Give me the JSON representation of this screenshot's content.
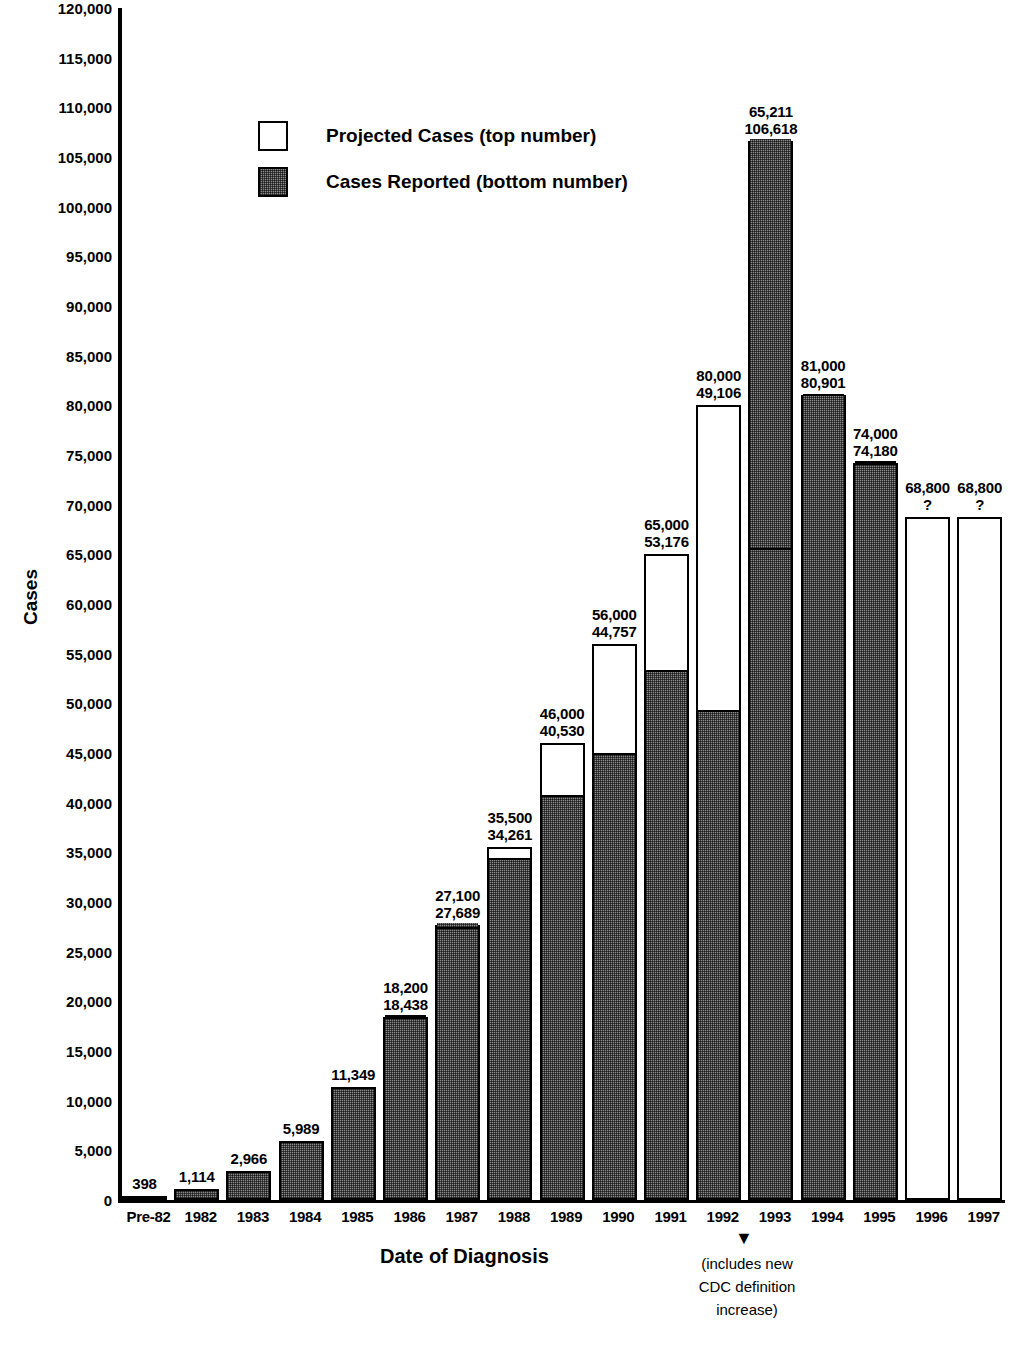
{
  "chart_data": {
    "type": "bar",
    "title": "",
    "xlabel": "Date of Diagnosis",
    "ylabel": "Cases",
    "ylim": [
      0,
      120000
    ],
    "ytick_step": 5000,
    "grid": false,
    "legend_position": "upper-left-inside",
    "categories": [
      "Pre-82",
      "1982",
      "1983",
      "1984",
      "1985",
      "1986",
      "1987",
      "1988",
      "1989",
      "1990",
      "1991",
      "1992",
      "1993",
      "1994",
      "1995",
      "1996",
      "1997"
    ],
    "series": [
      {
        "name": "Projected Cases (top number)",
        "key": "projected",
        "values": [
          null,
          null,
          null,
          null,
          null,
          18200,
          27100,
          35500,
          46000,
          56000,
          65000,
          80000,
          65211,
          81000,
          74000,
          68800,
          68800
        ]
      },
      {
        "name": "Cases Reported (bottom number)",
        "key": "reported",
        "values": [
          398,
          1114,
          2966,
          5989,
          11349,
          18438,
          27689,
          34261,
          40530,
          44757,
          53176,
          49106,
          106618,
          80901,
          74180,
          null,
          null
        ]
      }
    ],
    "bar_labels": [
      {
        "category": "Pre-82",
        "top": "",
        "bottom": "398"
      },
      {
        "category": "1982",
        "top": "",
        "bottom": "1,114"
      },
      {
        "category": "1983",
        "top": "",
        "bottom": "2,966"
      },
      {
        "category": "1984",
        "top": "",
        "bottom": "5,989"
      },
      {
        "category": "1985",
        "top": "",
        "bottom": "11,349"
      },
      {
        "category": "1986",
        "top": "18,200",
        "bottom": "18,438"
      },
      {
        "category": "1987",
        "top": "27,100",
        "bottom": "27,689"
      },
      {
        "category": "1988",
        "top": "35,500",
        "bottom": "34,261"
      },
      {
        "category": "1989",
        "top": "46,000",
        "bottom": "40,530"
      },
      {
        "category": "1990",
        "top": "56,000",
        "bottom": "44,757"
      },
      {
        "category": "1991",
        "top": "65,000",
        "bottom": "53,176"
      },
      {
        "category": "1992",
        "top": "80,000",
        "bottom": "49,106"
      },
      {
        "category": "1993",
        "top": "65,211",
        "bottom": "106,618"
      },
      {
        "category": "1994",
        "top": "81,000",
        "bottom": "80,901"
      },
      {
        "category": "1995",
        "top": "74,000",
        "bottom": "74,180"
      },
      {
        "category": "1996",
        "top": "68,800",
        "bottom": "?"
      },
      {
        "category": "1997",
        "top": "68,800",
        "bottom": "?"
      }
    ],
    "ytick_labels": [
      "120,000",
      "115,000",
      "110,000",
      "105,000",
      "100,000",
      "95,000",
      "90,000",
      "85,000",
      "80,000",
      "75,000",
      "70,000",
      "65,000",
      "60,000",
      "55,000",
      "50,000",
      "45,000",
      "40,000",
      "35,000",
      "30,000",
      "25,000",
      "20,000",
      "15,000",
      "10,000",
      "5,000",
      "0"
    ],
    "ytick_values": [
      120000,
      115000,
      110000,
      105000,
      100000,
      95000,
      90000,
      85000,
      80000,
      75000,
      70000,
      65000,
      60000,
      55000,
      50000,
      45000,
      40000,
      35000,
      30000,
      25000,
      20000,
      15000,
      10000,
      5000,
      0
    ],
    "annotations": [
      {
        "target": "1993",
        "arrow": "▼",
        "text": "(includes new\nCDC definition\nincrease)"
      }
    ],
    "colors": {
      "projected_fill": "#ffffff",
      "reported_fill": "#8a8a8a",
      "outline": "#000000",
      "background": "#ffffff"
    }
  },
  "legend": {
    "items": [
      {
        "label": "Projected Cases (top number)",
        "swatch": "open"
      },
      {
        "label": "Cases Reported (bottom number)",
        "swatch": "hatched"
      }
    ]
  },
  "axes": {
    "x_title": "Date of Diagnosis",
    "y_title": "Cases"
  }
}
